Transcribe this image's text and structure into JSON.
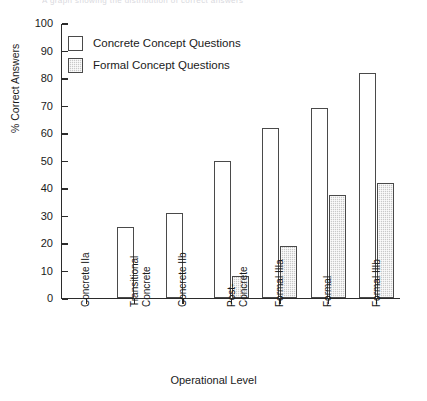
{
  "clipped_header": "A graph showing the distribution of correct answers",
  "chart_data": {
    "type": "bar",
    "title": "",
    "xlabel": "Operational Level",
    "ylabel": "% Correct Answers",
    "ylim": [
      0,
      100
    ],
    "yticks": [
      0,
      10,
      20,
      30,
      40,
      50,
      60,
      70,
      80,
      90,
      100
    ],
    "grid": false,
    "legend_position": "upper-left",
    "categories": [
      "Concrete IIa",
      "Transitional\nConcrete",
      "Concrete IIb",
      "Post-\nConcrete",
      "Formal IIIa",
      "Formal",
      "Formal IIIb"
    ],
    "series": [
      {
        "name": "Concrete Concept Questions",
        "fill": "open",
        "color": "#ffffff",
        "values": [
          0,
          26,
          31,
          50,
          62,
          69,
          82
        ]
      },
      {
        "name": "Formal Concept Questions",
        "fill": "hatched",
        "color": "#c9c9c9",
        "values": [
          0,
          0,
          0,
          8,
          19,
          37.5,
          42
        ]
      }
    ]
  },
  "legend": {
    "items": [
      {
        "label": "Concrete Concept Questions",
        "style": "concrete"
      },
      {
        "label": "Formal Concept Questions",
        "style": "formal"
      }
    ]
  }
}
